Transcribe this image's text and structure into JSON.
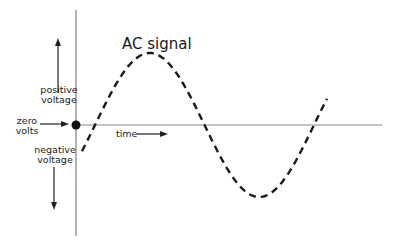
{
  "title": "AC signal",
  "labels": {
    "positive_voltage": [
      "positive",
      "voltage"
    ],
    "zero_volts": [
      "zero",
      "volts"
    ],
    "negative_voltage": [
      "negative",
      "voltage"
    ],
    "time": "time"
  },
  "signal": {
    "type": "sine",
    "line_style": "dashed",
    "cycles_shown": 1.2,
    "start_phase_deg": -20
  },
  "colors": {
    "axis": "#555555",
    "wave": "#1a1a1a",
    "text": "#222222"
  }
}
